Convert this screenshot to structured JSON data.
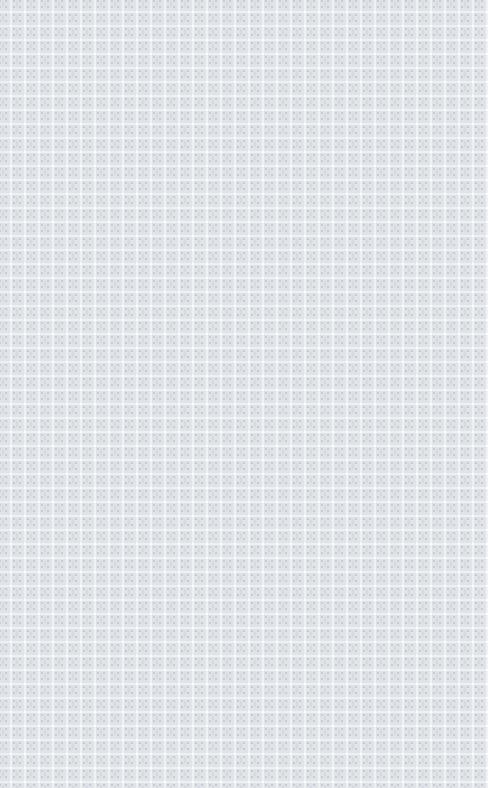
{
  "image": {
    "kind": "seamless-decorative-tile-pattern",
    "description": "Repeating pale gray ornamental tile texture on white; no user interface elements, text, controls or chrome are present.",
    "width_px": 488,
    "height_px": 788,
    "has_text": false,
    "has_ui_controls": false
  },
  "pattern": {
    "tile_width_px": 14,
    "tile_height_px": 14,
    "tiles_across": 35,
    "tiles_down": 57,
    "offset_x_px": -4,
    "offset_y_px": -3,
    "gutter_px": 2,
    "motif_name": "diamond-star-with-corner-blocks",
    "edges_clipped": true
  },
  "colors": {
    "background": "#ffffff",
    "gutter": "#ffffff",
    "cell_fill": "#eef0f2",
    "cell_fill_alt": "#f1f2f4",
    "ornament_light": "#dfe3e7",
    "ornament_mid": "#d2d7dd",
    "ornament_dark": "#c8ccd2",
    "noise": "#e6e9ec"
  },
  "motif": {
    "center_shape": "vertical-diamond",
    "corner_shape": "square-block",
    "corner_count": 4,
    "symmetry": "4-fold mirror"
  }
}
